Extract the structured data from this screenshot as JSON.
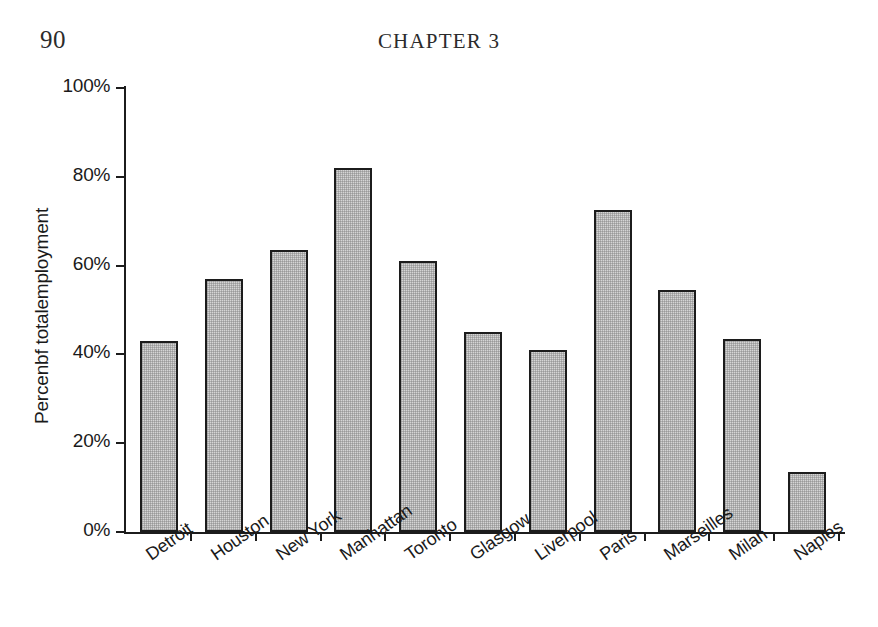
{
  "page": {
    "number": "90",
    "running_head": "CHAPTER 3"
  },
  "chart_data": {
    "type": "bar",
    "title": "",
    "xlabel": "",
    "ylabel": "Percenbf totalemployment",
    "ylim": [
      0,
      100
    ],
    "ytick_labels": [
      "100%",
      "80%",
      "60%",
      "40%",
      "20%",
      "0%"
    ],
    "ytick_values": [
      100,
      80,
      60,
      40,
      20,
      0
    ],
    "grid": false,
    "legend": null,
    "categories": [
      "Detroit",
      "Houston",
      "New York",
      "Manhattan",
      "Toronto",
      "Glasgow",
      "Liverpool",
      "Paris",
      "Marseilles",
      "Milan",
      "Naples"
    ],
    "values": [
      43,
      57,
      63.5,
      82,
      61,
      45,
      41,
      72.5,
      54.5,
      43.5,
      13.5
    ],
    "bar_fill_color": "#d5d5d5",
    "bar_border_color": "#1c1c1c",
    "axis_color": "#1c1c1c"
  }
}
